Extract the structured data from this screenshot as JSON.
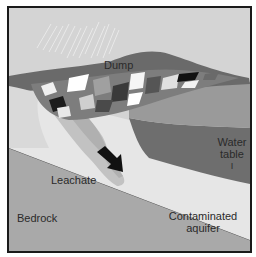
{
  "diagram": {
    "labels": {
      "dump": "Dump",
      "water_table_line1": "Water",
      "water_table_line2": "table",
      "water_table_marker": "I",
      "leachate": "Leachate",
      "bedrock": "Bedrock",
      "contaminated_line1": "Contaminated",
      "contaminated_line2": "aquifer"
    },
    "colors": {
      "sky": "#d4d4d4",
      "rain": "#ececec",
      "topsoil": "#7a7a7a",
      "hill": "#8c8c8c",
      "water_table_band": "#6e6e6e",
      "aquifer": "#e6e6e6",
      "plume": "#bdbdbd",
      "bedrock": "#a9a9a9",
      "border": "#1a1a1a",
      "arrow": "#111111"
    }
  }
}
